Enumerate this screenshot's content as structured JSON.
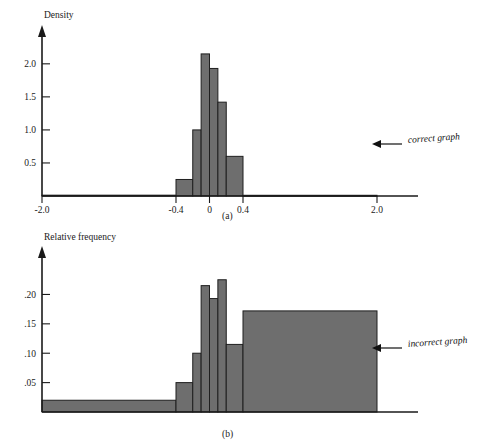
{
  "figure": {
    "panel_a_caption": "(a)",
    "panel_b_caption": "(b)",
    "annotation_correct": "correct graph",
    "annotation_incorrect": "incorrect graph",
    "bar_fill_color": "#6e6e6e",
    "bar_stroke_color": "#1f1f1f",
    "background_color": "#ffffff"
  },
  "chart_data": [
    {
      "type": "bar",
      "id": "panel-a",
      "title": "",
      "ylabel": "Density",
      "xlabel": "",
      "grid": false,
      "legend": "none",
      "annotation": "correct graph",
      "caption": "(a)",
      "xlim": [
        -2.0,
        2.0
      ],
      "ylim": [
        0,
        2.3
      ],
      "xticks": [
        -2.0,
        -0.4,
        0,
        0.4,
        2.0
      ],
      "xtick_labels": [
        "-2.0",
        "-0.4",
        "0",
        "0.4",
        "2.0"
      ],
      "yticks": [
        0.5,
        1.0,
        1.5,
        2.0
      ],
      "ytick_labels": [
        "0.5",
        "1.0",
        "1.5",
        "2.0"
      ],
      "note": "Density histogram with unequal class widths; bar area equals relative frequency.",
      "bins": [
        {
          "x0": -2.0,
          "x1": -0.4,
          "density": 0.0125,
          "relative_frequency": 0.02
        },
        {
          "x0": -0.4,
          "x1": -0.2,
          "density": 0.25,
          "relative_frequency": 0.05
        },
        {
          "x0": -0.2,
          "x1": -0.1,
          "density": 1.0,
          "relative_frequency": 0.1
        },
        {
          "x0": -0.1,
          "x1": 0.0,
          "density": 2.15,
          "relative_frequency": 0.215
        },
        {
          "x0": 0.0,
          "x1": 0.1,
          "density": 1.93,
          "relative_frequency": 0.193
        },
        {
          "x0": 0.1,
          "x1": 0.2,
          "density": 1.42,
          "relative_frequency": 0.142
        },
        {
          "x0": 0.2,
          "x1": 0.4,
          "density": 0.6,
          "relative_frequency": 0.12
        },
        {
          "x0": 0.4,
          "x1": 2.0,
          "density": 0.0108,
          "relative_frequency": 0.0172
        }
      ]
    },
    {
      "type": "bar",
      "id": "panel-b",
      "title": "",
      "ylabel": "Relative frequency",
      "xlabel": "",
      "grid": false,
      "legend": "none",
      "annotation": "incorrect graph",
      "caption": "(b)",
      "ylim": [
        0,
        0.245
      ],
      "xticks": [],
      "xtick_labels": [],
      "yticks": [
        0.05,
        0.1,
        0.15,
        0.2
      ],
      "ytick_labels": [
        ".05",
        ".10",
        ".15",
        ".20"
      ],
      "note": "Incorrect histogram: bar heights set to relative frequency while class widths remain unequal.",
      "bins": [
        {
          "x0": -2.0,
          "x1": -0.4,
          "relative_frequency": 0.02
        },
        {
          "x0": -0.4,
          "x1": -0.2,
          "relative_frequency": 0.05
        },
        {
          "x0": -0.2,
          "x1": -0.1,
          "relative_frequency": 0.1
        },
        {
          "x0": -0.1,
          "x1": 0.0,
          "relative_frequency": 0.215
        },
        {
          "x0": 0.0,
          "x1": 0.1,
          "relative_frequency": 0.193
        },
        {
          "x0": 0.1,
          "x1": 0.2,
          "relative_frequency": 0.225
        },
        {
          "x0": 0.2,
          "x1": 0.4,
          "relative_frequency": 0.115
        },
        {
          "x0": 0.4,
          "x1": 2.0,
          "relative_frequency": 0.172
        }
      ]
    }
  ]
}
